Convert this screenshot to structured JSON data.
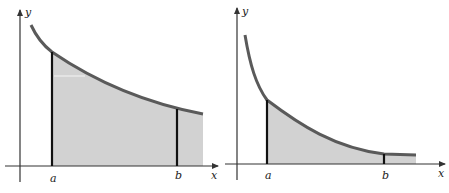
{
  "figure": {
    "colors": {
      "curve": "#5a5a5a",
      "fill": "#d2d2d2",
      "axis": "#333333",
      "bound": "#111111"
    },
    "panels": [
      {
        "name": "left-panel",
        "description": "Slowly decaying curve with shaded area from a to b and beyond",
        "labels": {
          "y": "y",
          "x": "x",
          "a": "a",
          "b": "b"
        }
      },
      {
        "name": "right-panel",
        "description": "Rapidly decaying curve with shaded area from a to b and beyond",
        "labels": {
          "y": "y",
          "x": "x",
          "a": "a",
          "b": "b"
        }
      }
    ]
  }
}
